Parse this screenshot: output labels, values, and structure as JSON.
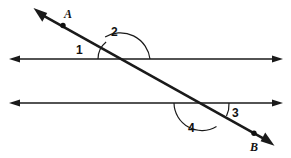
{
  "figure": {
    "background_color": "#ffffff",
    "stroke_color": "#1a1a1a"
  },
  "points": [
    {
      "name": "A",
      "label": "A",
      "x": 63,
      "y": 25,
      "label_x": 64,
      "label_y": 8
    },
    {
      "name": "B",
      "label": "B",
      "x": 254,
      "y": 133,
      "label_x": 250,
      "label_y": 141
    }
  ],
  "lines": [
    {
      "name": "upper-parallel-line",
      "kind": "double-arrow-line",
      "x1": 12,
      "y1": 59,
      "x2": 280,
      "y2": 59
    },
    {
      "name": "lower-parallel-line",
      "kind": "double-arrow-line",
      "x1": 12,
      "y1": 103,
      "x2": 280,
      "y2": 103
    },
    {
      "name": "transversal-line-ab",
      "kind": "double-arrow-line",
      "x1": 37,
      "y1": 12,
      "x2": 270,
      "y2": 142
    }
  ],
  "intersections": [
    {
      "name": "upper-intersection",
      "x": 120,
      "y": 59
    },
    {
      "name": "lower-intersection",
      "x": 202,
      "y": 103
    }
  ],
  "angles": [
    {
      "name": "angle-1",
      "label": "1",
      "at": "upper-intersection",
      "position": "left of transversal, above upper line",
      "label_x": 76,
      "label_y": 44
    },
    {
      "name": "angle-2",
      "label": "2",
      "at": "upper-intersection",
      "position": "above upper line, right of transversal",
      "label_x": 111,
      "label_y": 26
    },
    {
      "name": "angle-3",
      "label": "3",
      "at": "lower-intersection",
      "position": "right of transversal, above lower line",
      "label_x": 232,
      "label_y": 107
    },
    {
      "name": "angle-4",
      "label": "4",
      "at": "lower-intersection",
      "position": "below lower line, left of transversal",
      "label_x": 188,
      "label_y": 122
    }
  ]
}
